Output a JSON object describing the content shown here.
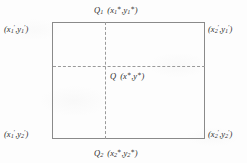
{
  "figure": {
    "kind": "rectangle-with-dashed-crosshair-diagram",
    "colors": {
      "background": "#fdfdfd",
      "rectangle_border": "#8a8a8a",
      "dashed_line": "#9a9a9a",
      "text": "#2e2e2e"
    }
  },
  "labels": {
    "top": {
      "point_name": "Q",
      "point_sub": "1",
      "coord_open": "(",
      "x_var": "x",
      "x_sub": "1",
      "x_sup": "∗",
      "comma": ",",
      "y_var": "y",
      "y_sub": "1",
      "y_sup": "∗",
      "coord_close": ")"
    },
    "bottom": {
      "point_name": "Q",
      "point_sub": "2",
      "coord_open": "(",
      "x_var": "x",
      "x_sub": "2",
      "x_sup": "∗",
      "comma": ",",
      "y_var": "y",
      "y_sub": "2",
      "y_sup": "∗",
      "coord_close": ")"
    },
    "top_left": {
      "coord_open": "(",
      "x_var": "x",
      "x_sub": "1",
      "x_sup": "′",
      "comma": ",",
      "y_var": "y",
      "y_sub": "1",
      "y_sup": "′",
      "coord_close": ")"
    },
    "top_right": {
      "coord_open": "(",
      "x_var": "x",
      "x_sub": "2",
      "x_sup": "′",
      "comma": ",",
      "y_var": "y",
      "y_sub": "1",
      "y_sup": "′",
      "coord_close": ")"
    },
    "bottom_left": {
      "coord_open": "(",
      "x_var": "x",
      "x_sub": "1",
      "x_sup": "′",
      "comma": ",",
      "y_var": "y",
      "y_sub": "2",
      "y_sup": "′",
      "coord_close": ")"
    },
    "bottom_right": {
      "coord_open": "(",
      "x_var": "x",
      "x_sub": "2",
      "x_sup": "′",
      "comma": ",",
      "y_var": "y",
      "y_sub": "2",
      "y_sup": "′",
      "coord_close": ")"
    },
    "center": {
      "point_name": "Q",
      "coord_open": "(",
      "x_var": "x",
      "x_sup": "∗",
      "comma": ",",
      "y_var": "y",
      "y_sup": "∗",
      "coord_close": ")"
    }
  }
}
